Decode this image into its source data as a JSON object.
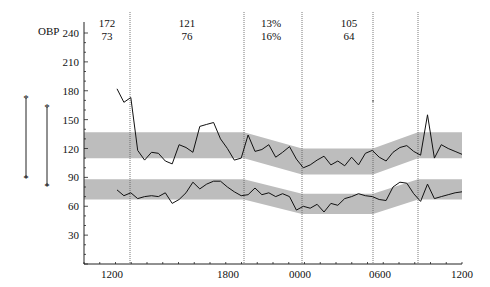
{
  "chart_data": {
    "type": "line",
    "title": "",
    "ylabel": "OBP",
    "xlabel": "",
    "ylim": [
      0,
      250
    ],
    "yticks": [
      "240",
      "210",
      "180",
      "150",
      "120",
      "90",
      "60",
      "30"
    ],
    "xticks": [
      "1200",
      "1800",
      "0000",
      "0600",
      "1200"
    ],
    "grid": false,
    "header_values": [
      {
        "top": "172",
        "bottom": "73"
      },
      {
        "top": "121",
        "bottom": "76"
      },
      {
        "top": "13%",
        "bottom": "16%"
      },
      {
        "top": "105",
        "bottom": "64"
      }
    ],
    "bands": {
      "systolic": {
        "low": [
          110,
          110,
          110,
          93,
          93,
          110,
          110
        ],
        "high": [
          137,
          137,
          137,
          120,
          120,
          137,
          137
        ]
      },
      "diastolic": {
        "low": [
          67,
          67,
          67,
          52,
          52,
          67,
          67
        ],
        "high": [
          88,
          88,
          88,
          73,
          73,
          88,
          88
        ]
      }
    },
    "series": [
      {
        "name": "Systolic",
        "values": [
          182,
          168,
          173,
          118,
          108,
          116,
          115,
          107,
          104,
          124,
          121,
          116,
          143,
          145,
          147,
          130,
          120,
          108,
          110,
          134,
          117,
          119,
          124,
          111,
          116,
          122,
          109,
          100,
          103,
          108,
          112,
          103,
          107,
          102,
          111,
          103,
          115,
          118,
          111,
          107,
          116,
          121,
          123,
          117,
          113,
          155,
          110,
          124,
          120,
          117,
          114
        ]
      },
      {
        "name": "Diastolic",
        "values": [
          77,
          71,
          74,
          68,
          70,
          71,
          70,
          74,
          63,
          67,
          74,
          85,
          78,
          83,
          86,
          86,
          80,
          75,
          71,
          72,
          79,
          72,
          74,
          70,
          73,
          70,
          56,
          60,
          58,
          62,
          54,
          63,
          61,
          68,
          70,
          73,
          71,
          70,
          67,
          66,
          80,
          85,
          84,
          73,
          65,
          83,
          68,
          70,
          72,
          74,
          75
        ]
      }
    ],
    "range_bars": [
      {
        "label": "left",
        "top_value": 170,
        "bottom_value": 85
      },
      {
        "label": "right",
        "top_value": 160,
        "bottom_value": 80
      }
    ]
  }
}
